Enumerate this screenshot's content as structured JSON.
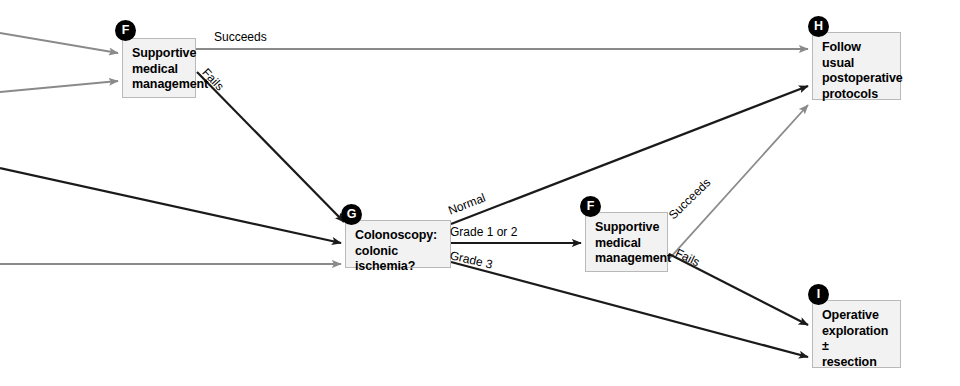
{
  "diagram": {
    "colors": {
      "node_fill": "#f2f2f2",
      "node_border": "#b9b9b9",
      "edge_black": "#1a1a1a",
      "edge_gray": "#8a8a8a",
      "badge_fill": "#000000",
      "badge_text": "#ffffff",
      "text": "#000000",
      "background": "#ffffff"
    },
    "nodes": [
      {
        "id": "F1",
        "badge": "F",
        "lines": [
          "Supportive",
          "medical",
          "management"
        ],
        "x": 122,
        "y": 38,
        "w": 74,
        "h": 60
      },
      {
        "id": "G",
        "badge": "G",
        "lines": [
          "Colonoscopy:",
          "colonic ischemia?"
        ],
        "x": 345,
        "y": 220,
        "w": 106,
        "h": 48
      },
      {
        "id": "F2",
        "badge": "F",
        "lines": [
          "Supportive",
          "medical",
          "management"
        ],
        "x": 585,
        "y": 212,
        "w": 83,
        "h": 60
      },
      {
        "id": "H",
        "badge": "H",
        "lines": [
          "Follow usual",
          "postoperative",
          "protocols"
        ],
        "x": 812,
        "y": 32,
        "w": 89,
        "h": 68
      },
      {
        "id": "I",
        "badge": "I",
        "lines": [
          "Operative",
          "exploration ±",
          "resection"
        ],
        "x": 812,
        "y": 300,
        "w": 89,
        "h": 68
      }
    ],
    "edge_labels": [
      {
        "id": "succeeds-f1",
        "text": "Succeeds",
        "x": 214,
        "y": 37,
        "rotate": 0
      },
      {
        "id": "fails-f1",
        "text": "Fails",
        "x": 204,
        "y": 68,
        "rotate": 47
      },
      {
        "id": "normal-g",
        "text": "Normal",
        "x": 449,
        "y": 210,
        "rotate": -21
      },
      {
        "id": "grade-1-or-2-g",
        "text": "Grade 1 or 2",
        "x": 449,
        "y": 230,
        "rotate": 0
      },
      {
        "id": "grade-3-g",
        "text": "Grade 3",
        "x": 449,
        "y": 252,
        "rotate": 13
      },
      {
        "id": "succeeds-f2",
        "text": "Succeeds",
        "x": 671,
        "y": 215,
        "rotate": -44
      },
      {
        "id": "fails-f2",
        "text": "Fails",
        "x": 676,
        "y": 250,
        "rotate": 26
      }
    ],
    "edges": [
      {
        "id": "in-f1-upper",
        "from": "left-edge",
        "to": "F1",
        "color": "gray"
      },
      {
        "id": "in-f1-lower",
        "from": "left-edge",
        "to": "F1",
        "color": "gray"
      },
      {
        "id": "f1-succeeds-h",
        "from": "F1",
        "to": "H",
        "label": "Succeeds",
        "color": "gray"
      },
      {
        "id": "f1-fails-g",
        "from": "F1",
        "to": "G",
        "label": "Fails",
        "color": "black"
      },
      {
        "id": "in-g-upper",
        "from": "left-edge",
        "to": "G",
        "color": "black"
      },
      {
        "id": "in-g-lower",
        "from": "left-edge",
        "to": "G",
        "color": "gray"
      },
      {
        "id": "g-normal-h",
        "from": "G",
        "to": "H",
        "label": "Normal",
        "color": "black"
      },
      {
        "id": "g-grade12-f2",
        "from": "G",
        "to": "F2",
        "label": "Grade 1 or 2",
        "color": "black"
      },
      {
        "id": "g-grade3-i",
        "from": "G",
        "to": "I",
        "label": "Grade 3",
        "color": "black"
      },
      {
        "id": "f2-succeeds-h",
        "from": "F2",
        "to": "H",
        "label": "Succeeds",
        "color": "gray"
      },
      {
        "id": "f2-fails-i",
        "from": "F2",
        "to": "I",
        "label": "Fails",
        "color": "black"
      }
    ]
  }
}
